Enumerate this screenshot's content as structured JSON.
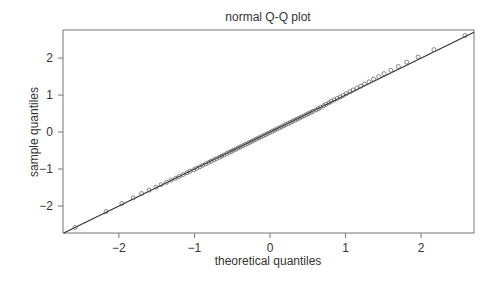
{
  "chart_data": {
    "type": "scatter",
    "title": "normal Q-Q plot",
    "xlabel": "theoretical quantiles",
    "ylabel": "sample quantiles",
    "xlim": [
      -2.74,
      2.7
    ],
    "ylim": [
      -2.73,
      2.76
    ],
    "xticks": [
      -2,
      -1,
      0,
      1,
      2
    ],
    "yticks": [
      -2,
      -1,
      0,
      1,
      2
    ],
    "xtick_labels": [
      "−2",
      "−1",
      "0",
      "1",
      "2"
    ],
    "ytick_labels": [
      "−2",
      "−1",
      "0",
      "1",
      "2"
    ],
    "grid": false,
    "legend": null,
    "reference_line": {
      "slope": 1.0,
      "intercept": 0.0
    },
    "marker": "open-circle",
    "series": [
      {
        "name": "sample",
        "x": [
          -2.58,
          -2.17,
          -1.96,
          -1.81,
          -1.7,
          -1.6,
          -1.51,
          -1.44,
          -1.37,
          -1.31,
          -1.25,
          -1.2,
          -1.15,
          -1.1,
          -1.06,
          -1.01,
          -0.97,
          -0.93,
          -0.89,
          -0.85,
          -0.81,
          -0.78,
          -0.74,
          -0.71,
          -0.67,
          -0.64,
          -0.61,
          -0.57,
          -0.54,
          -0.51,
          -0.48,
          -0.45,
          -0.42,
          -0.39,
          -0.36,
          -0.33,
          -0.3,
          -0.27,
          -0.24,
          -0.21,
          -0.18,
          -0.15,
          -0.12,
          -0.09,
          -0.06,
          -0.03,
          0.0,
          0.03,
          0.06,
          0.09,
          0.12,
          0.15,
          0.18,
          0.21,
          0.24,
          0.27,
          0.3,
          0.33,
          0.36,
          0.39,
          0.42,
          0.45,
          0.48,
          0.51,
          0.54,
          0.57,
          0.61,
          0.64,
          0.67,
          0.71,
          0.74,
          0.78,
          0.81,
          0.85,
          0.89,
          0.93,
          0.97,
          1.01,
          1.06,
          1.1,
          1.15,
          1.2,
          1.25,
          1.31,
          1.37,
          1.44,
          1.51,
          1.6,
          1.7,
          1.81,
          1.96,
          2.17,
          2.58
        ],
        "y": [
          -2.58,
          -2.15,
          -1.93,
          -1.78,
          -1.66,
          -1.57,
          -1.49,
          -1.42,
          -1.36,
          -1.3,
          -1.25,
          -1.2,
          -1.15,
          -1.1,
          -1.06,
          -1.02,
          -0.98,
          -0.94,
          -0.9,
          -0.86,
          -0.82,
          -0.79,
          -0.75,
          -0.72,
          -0.68,
          -0.65,
          -0.62,
          -0.58,
          -0.55,
          -0.52,
          -0.49,
          -0.46,
          -0.43,
          -0.4,
          -0.37,
          -0.34,
          -0.31,
          -0.28,
          -0.25,
          -0.22,
          -0.19,
          -0.16,
          -0.13,
          -0.1,
          -0.07,
          -0.04,
          -0.01,
          0.02,
          0.05,
          0.08,
          0.11,
          0.14,
          0.17,
          0.2,
          0.23,
          0.26,
          0.29,
          0.32,
          0.35,
          0.38,
          0.41,
          0.44,
          0.47,
          0.5,
          0.53,
          0.56,
          0.6,
          0.63,
          0.67,
          0.71,
          0.75,
          0.79,
          0.83,
          0.87,
          0.91,
          0.95,
          0.99,
          1.04,
          1.09,
          1.14,
          1.19,
          1.24,
          1.3,
          1.36,
          1.43,
          1.5,
          1.58,
          1.67,
          1.77,
          1.89,
          2.03,
          2.23,
          2.61
        ]
      }
    ]
  },
  "layout": {
    "plot": {
      "left": 63,
      "top": 30,
      "right": 474,
      "bottom": 233
    },
    "colors": {
      "axis": "#777777",
      "line": "#333333",
      "point": "#555555",
      "text": "#333333"
    }
  }
}
